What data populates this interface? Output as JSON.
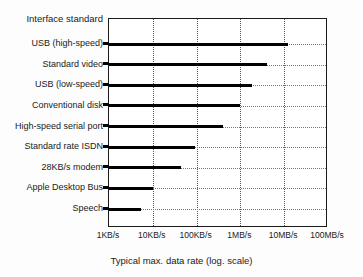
{
  "chart_data": {
    "type": "bar",
    "orientation": "horizontal",
    "title": "",
    "xlabel": "Typical max. data rate (log. scale)",
    "ylabel": "Interface standard",
    "scale": "log",
    "grid": true,
    "legend": null,
    "xlim": [
      1000,
      100000000
    ],
    "xticks": [
      {
        "label": "1KB/s",
        "value": 1000
      },
      {
        "label": "10KB/s",
        "value": 10000
      },
      {
        "label": "100KB/s",
        "value": 100000
      },
      {
        "label": "1MB/s",
        "value": 1000000
      },
      {
        "label": "10MB/s",
        "value": 10000000
      },
      {
        "label": "100MB/s",
        "value": 100000000
      }
    ],
    "categories": [
      "USB (high-speed)",
      "Standard video",
      "USB (low-speed)",
      "Conventional disk",
      "High-speed serial port",
      "Standard rate ISDN",
      "28KB/s modem",
      "Apple Desktop Bus",
      "Speech"
    ],
    "values": [
      12000000,
      4000000,
      1800000,
      1000000,
      400000,
      90000,
      45000,
      10000,
      5500
    ],
    "value_labels": [
      "~12MB/s",
      "~4MB/s",
      "~1.8MB/s",
      "~1MB/s",
      "~400KB/s",
      "~90KB/s",
      "~45KB/s",
      "~10KB/s",
      "~5.5KB/s"
    ]
  },
  "axis": {
    "y_title": "Interface standard",
    "x_caption": "Typical max. data rate (log. scale)"
  }
}
